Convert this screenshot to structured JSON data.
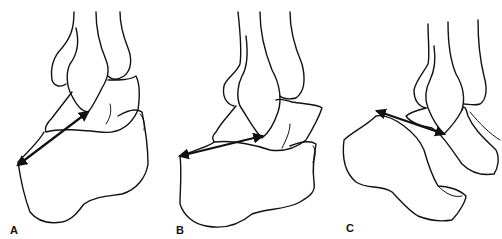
{
  "figure": {
    "panels": [
      {
        "id": "A",
        "label": "A"
      },
      {
        "id": "B",
        "label": "B"
      },
      {
        "id": "C",
        "label": "C"
      }
    ],
    "colors": {
      "line": "#111111",
      "background": "#ffffff"
    }
  }
}
